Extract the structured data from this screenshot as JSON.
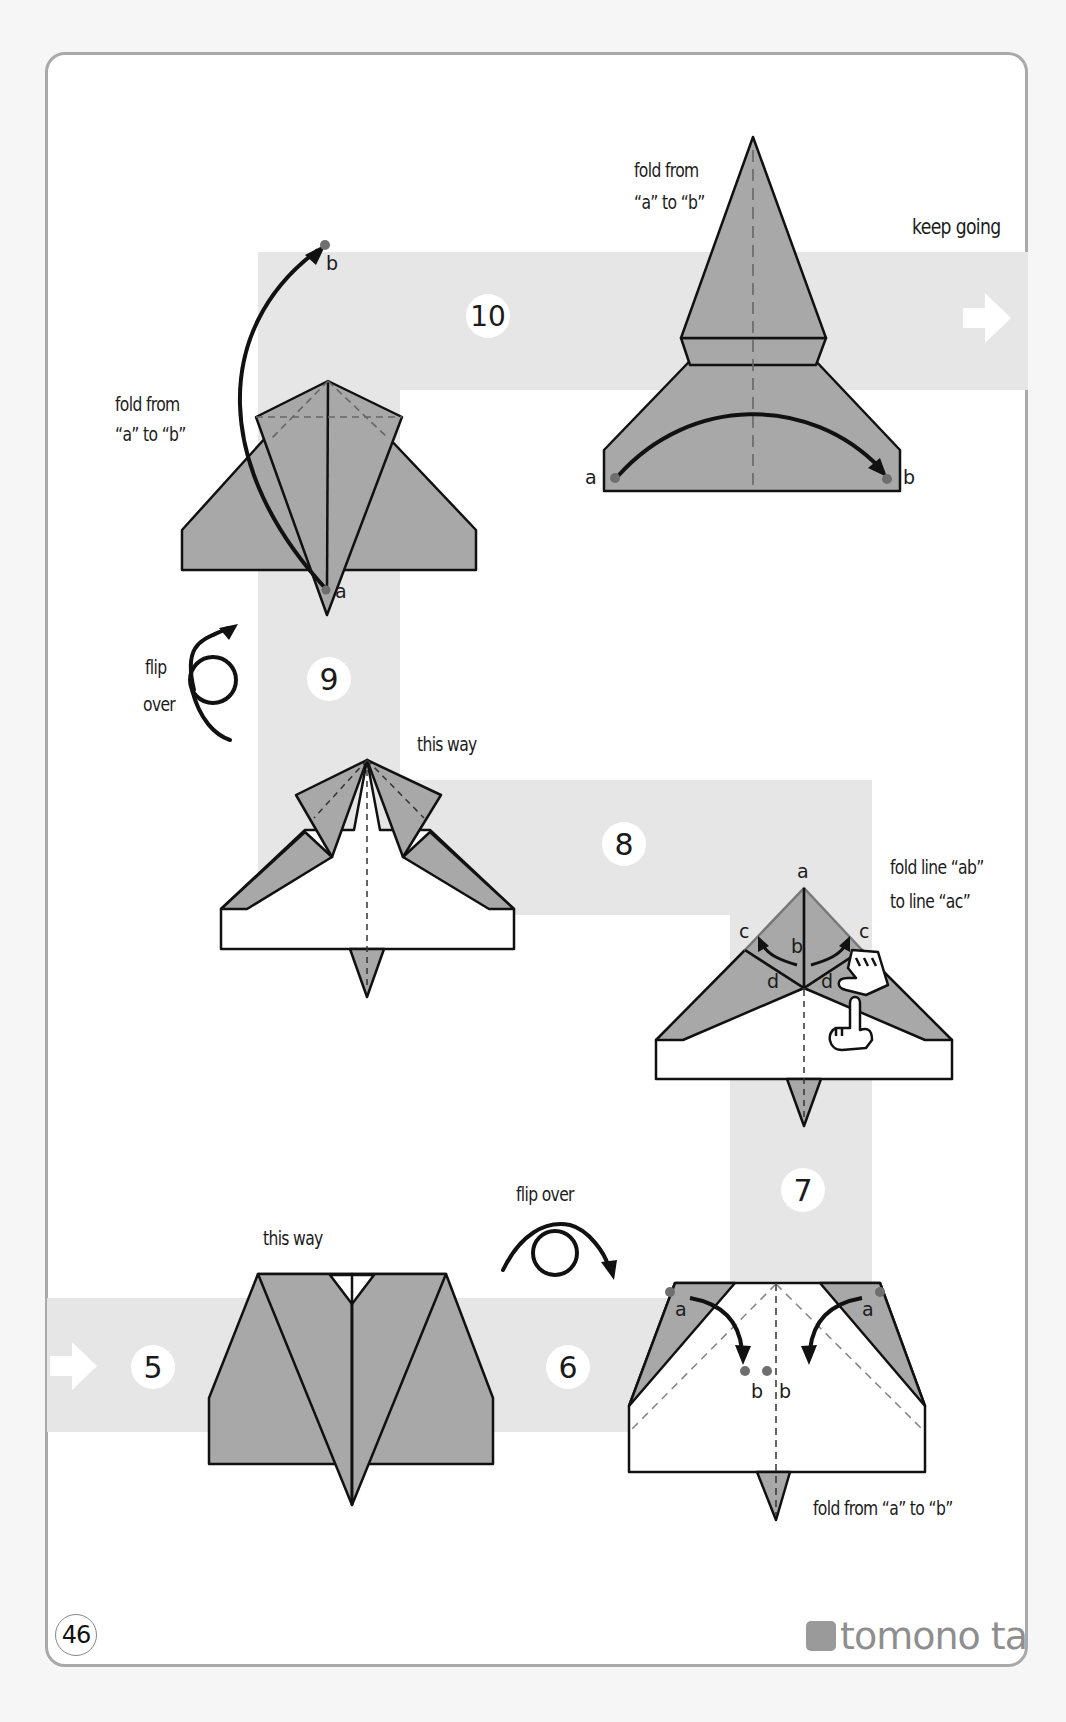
{
  "page": {
    "page_number": "46",
    "brand": "tomono ta",
    "colors": {
      "band": "#e6e6e6",
      "paper_gray": "#a8a8a8",
      "paper_white": "#ffffff",
      "outline": "#111111",
      "dot": "#6f6f6f",
      "card_border": "#a9a9a9"
    }
  },
  "steps": [
    {
      "number": "5",
      "labels": {
        "top": "this way"
      }
    },
    {
      "number": "6",
      "labels": {
        "action": "flip over"
      }
    },
    {
      "number": "7",
      "labels": {
        "instruction": "fold from “a” to “b”"
      },
      "points": [
        "a",
        "a",
        "b",
        "b"
      ]
    },
    {
      "number": "8",
      "labels": {
        "instruction_line1": "fold line “ab”",
        "instruction_line2": "to line “ac”"
      },
      "points": [
        "a",
        "b",
        "c",
        "c",
        "d",
        "d"
      ]
    },
    {
      "number": "9",
      "labels": {
        "top": "this way",
        "action_line1": "flip",
        "action_line2": "over"
      }
    },
    {
      "number": "10",
      "labels": {
        "left_line1": "fold from",
        "left_line2": "“a” to “b”",
        "right_line1": "fold from",
        "right_line2": "“a” to “b”",
        "continue": "keep going"
      },
      "points": [
        "a",
        "b",
        "a",
        "b"
      ]
    }
  ],
  "icons": {
    "continue_arrow_right": "arrow-right-icon",
    "start_arrow_right": "arrow-right-icon",
    "flip_over_step9": "flip-over-icon",
    "flip_over_step6": "flip-over-icon",
    "hand_pinch": "hand-icon",
    "hand_point": "hand-pointer-icon",
    "logo": "logo-icon"
  }
}
